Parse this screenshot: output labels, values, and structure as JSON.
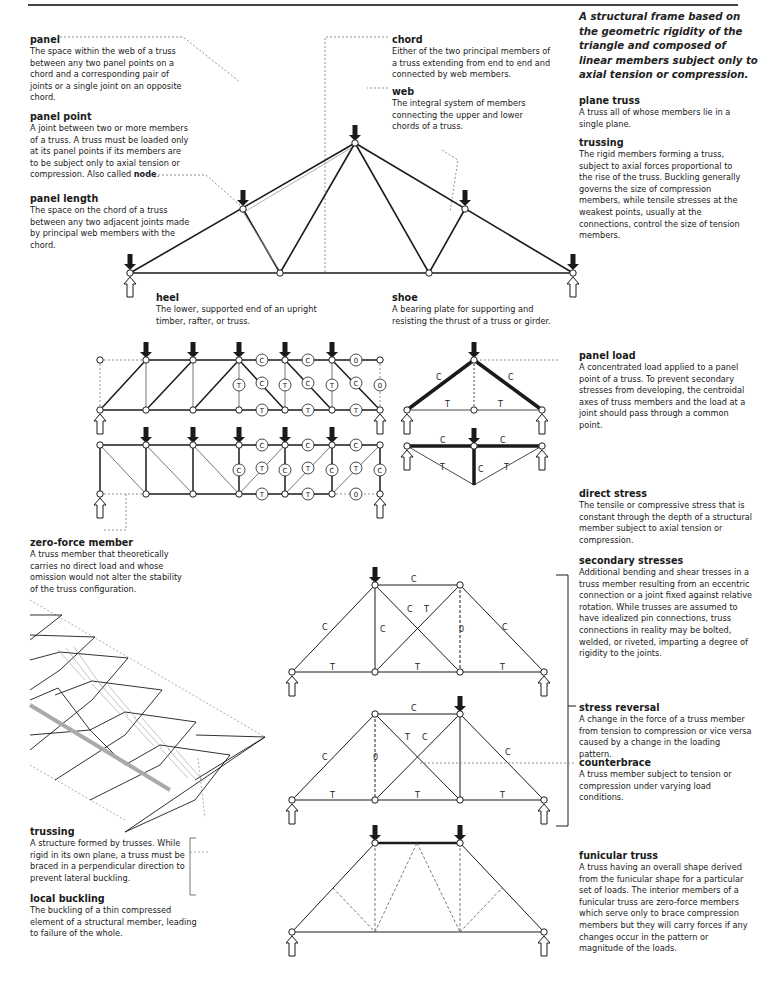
{
  "header": {
    "title": "TRUSS"
  },
  "intro": "A structural frame based on the geometric rigidity of the triangle and composed of linear members subject only to axial tension or compression.",
  "entries": {
    "panel": {
      "term": "panel",
      "def": "The space within the web of a truss between any two panel points on a chord and a corresponding pair of joints or a single joint on an opposite chord."
    },
    "panel_point": {
      "term": "panel point",
      "def": "A joint between two or more members of a truss. A truss must be loaded only at its panel points if its members are to be subject only to axial tension or compression. Also called ",
      "def_bold": "node",
      "def_end": "."
    },
    "panel_length": {
      "term": "panel length",
      "def": "The space on the chord of a truss between any two adjacent joints made by principal web members with the chord."
    },
    "chord": {
      "term": "chord",
      "def": "Either of the two principal members of a truss extending from end to end and connected by web members."
    },
    "web": {
      "term": "web",
      "def": "The integral system of members connecting the upper and lower chords of a truss."
    },
    "plane_truss": {
      "term": "plane truss",
      "def": "A truss all of whose members lie in a single plane."
    },
    "trussing_members": {
      "term": "trussing",
      "def": "The rigid members forming a truss, subject to axial forces proportional to the rise of the truss. Buckling generally governs the size of compression members, while tensile stresses at the weakest points, usually at the connections, control the size of tension members."
    },
    "heel": {
      "term": "heel",
      "def": "The lower, supported end of an upright timber, rafter, or truss."
    },
    "shoe": {
      "term": "shoe",
      "def": "A bearing plate for supporting and resisting the thrust of a truss or girder."
    },
    "panel_load": {
      "term": "panel load",
      "def": "A concentrated load applied to a panel point of a truss. To prevent secondary stresses from developing, the centroidal axes of truss members and the load at a joint should pass through a common point."
    },
    "zero_force_member": {
      "term": "zero-force member",
      "def": "A truss member that theoretically carries no direct load and whose omission would not alter the stability of the truss configuration."
    },
    "direct_stress": {
      "term": "direct stress",
      "def": "The tensile or compressive stress that is constant through the depth of a structural member subject to axial tension or compression."
    },
    "secondary_stresses": {
      "term": "secondary stresses",
      "def": "Additional bending and shear tresses in a truss member resulting from an eccentric connection or a joint fixed against relative rotation. While trusses are assumed to have idealized pin connections, truss connections in reality may be bolted, welded, or riveted, imparting a degree of rigidity to the joints."
    },
    "stress_reversal": {
      "term": "stress reversal",
      "def": "A change in the force of a truss member from tension to compression or vice versa caused by a change in the loading pattern."
    },
    "counterbrace": {
      "term": "counterbrace",
      "def": "A truss member subject to tension or compression under varying load conditions."
    },
    "trussing_structure": {
      "term": "trussing",
      "def": "A structure formed by trusses. While rigid in its own plane, a truss must be braced in a perpendicular direction to prevent lateral buckling."
    },
    "local_buckling": {
      "term": "local buckling",
      "def": "The buckling of a thin compressed element of a structural member, leading to failure of the whole."
    },
    "funicular_truss": {
      "term": "funicular truss",
      "def": "A truss having an overall shape derived from the funicular shape for a particular set of loads. The interior members of a funicular truss are zero-force members which serve only to brace compression members but they will carry forces if any changes occur in the pattern or magnitude of the loads."
    }
  },
  "diagram_labels": {
    "compression": "C",
    "tension": "T",
    "zero": "0"
  },
  "colors": {
    "ink": "#1a1a1a",
    "leader": "#777777",
    "background": "#ffffff"
  }
}
